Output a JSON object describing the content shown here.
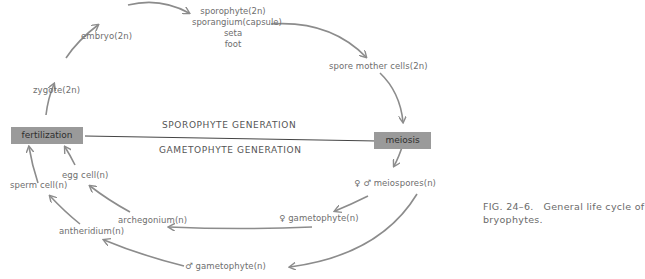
{
  "figure": {
    "caption_line1": "FIG. 24–6.   General life cycle of",
    "caption_line2": "bryophytes."
  },
  "generations": {
    "sporophyte": "SPOROPHYTE GENERATION",
    "gametophyte": "GAMETOPHYTE GENERATION"
  },
  "boxes": {
    "fertilization": "fertilization",
    "meiosis": "meiosis"
  },
  "nodes": {
    "zygote": "zygote(2n)",
    "embryo": "embryo(2n)",
    "sporophyte": {
      "title": "sporophyte(2n)",
      "parts": [
        "sporangium(capsule)",
        "seta",
        "foot"
      ]
    },
    "spore_mother_cells": "spore mother cells(2n)",
    "meiospores": "♀ ♂ meiospores(n)",
    "female_gametophyte": "♀ gametophyte(n)",
    "male_gametophyte": "♂ gametophyte(n)",
    "archegonium": "archegonium(n)",
    "antheridium": "antheridium(n)",
    "egg_cell": "egg cell(n)",
    "sperm_cell": "sperm cell(n)"
  },
  "colors": {
    "arrow": "#8c8c8c",
    "box_fill": "#9a9a9a",
    "divider": "#444444"
  }
}
